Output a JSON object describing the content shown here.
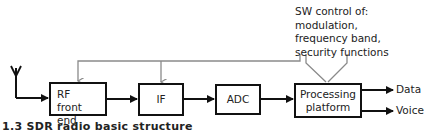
{
  "diagram": {
    "title": "SDR radio basic structure",
    "blocks": [
      {
        "id": "rf",
        "label_line1": "RF",
        "label_line2": "front end"
      },
      {
        "id": "if",
        "label": "IF"
      },
      {
        "id": "adc",
        "label": "ADC"
      },
      {
        "id": "proc",
        "label_line1": "Processing",
        "label_line2": "platform"
      }
    ],
    "sw_control": {
      "line1": "SW control of:",
      "line2": "modulation,",
      "line3": "frequency band,",
      "line4": "security functions"
    },
    "outputs": [
      {
        "label": "Data"
      },
      {
        "label": "Voice"
      }
    ],
    "caption": "1.3    SDR radio basic structure",
    "colors": {
      "signal_line": "#111111",
      "control_line": "#8a8a8a",
      "text": "#222222"
    }
  }
}
